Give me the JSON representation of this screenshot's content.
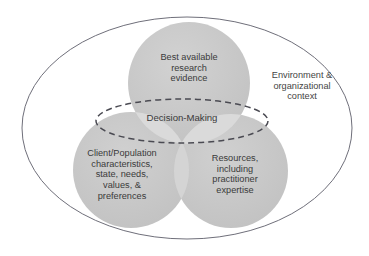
{
  "diagram": {
    "type": "venn-diagram",
    "outer_boundary": {
      "shape": "ellipse",
      "label": "Environment &\norganizational\ncontext",
      "stroke_color": "#6f6f7a",
      "fill_color": "#ffffff"
    },
    "center_overlap": {
      "shape": "dashed-ellipse",
      "label": "Decision-Making",
      "stroke_color": "#4a4a52",
      "stroke_style": "dashed"
    },
    "circles": [
      {
        "id": "top",
        "position": "top-center",
        "label": "Best available\nresearch\nevidence",
        "fill_color": "#c6c6c6"
      },
      {
        "id": "left",
        "position": "bottom-left",
        "label": "Client/Population\ncharacteristics,\nstate, needs,\nvalues, &\npreferences",
        "fill_color": "#c6c6c6"
      },
      {
        "id": "right",
        "position": "bottom-right",
        "label": "Resources,\nincluding\npractitioner\nexpertise",
        "fill_color": "#c6c6c6"
      }
    ],
    "colors": {
      "circle_fill": "#c6c6c6",
      "overlap_fill": "#d8d8d8",
      "triple_overlap_fill": "#e4e4e4",
      "text": "#3a3a3a",
      "outline": "#6f6f7a",
      "background": "#ffffff"
    }
  }
}
